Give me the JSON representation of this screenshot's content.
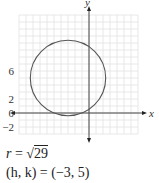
{
  "chart_data": {
    "type": "line",
    "title": "",
    "xlabel": "x",
    "ylabel": "y",
    "xlim": [
      -10,
      7
    ],
    "ylim": [
      -3,
      14
    ],
    "grid": true,
    "grid_step": 1,
    "x_tick_labels": [
      "-6",
      "-2",
      "0",
      "2",
      "6"
    ],
    "x_ticks": [
      -6,
      -2,
      0,
      2,
      6
    ],
    "y_tick_labels": [
      "6",
      "2",
      "0",
      "-2"
    ],
    "y_ticks": [
      6,
      2,
      0,
      -2
    ],
    "series": [
      {
        "name": "circle",
        "shape": "circle",
        "center": [
          -3,
          5
        ],
        "radius_squared": 29,
        "color": "#555555"
      }
    ],
    "annotations": [
      {
        "text": "r = √29"
      },
      {
        "text": "(h, k) = (−3, 5)"
      }
    ]
  },
  "text": {
    "radius_prefix": "r = ",
    "radius_value": "29",
    "center_label": "(h, k) = (−3, 5)"
  }
}
